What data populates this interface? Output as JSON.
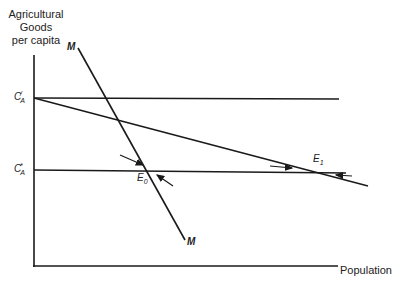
{
  "diagram": {
    "y_axis_label": "Agricultural Goods per capita",
    "y_axis_label_lines": [
      "Agricultural",
      "Goods",
      "per capita"
    ],
    "x_axis_label": "Population",
    "levels": {
      "upper": {
        "symbol": "C",
        "sub": "A",
        "sup": "/",
        "y": 98
      },
      "lower": {
        "symbol": "C",
        "sub": "A",
        "sup": "*",
        "y": 170
      }
    },
    "curves": {
      "M": {
        "label": "M",
        "top_label": "M",
        "bottom_label": "M"
      },
      "declining": {
        "label": ""
      }
    },
    "equilibria": [
      {
        "label": "E",
        "sub": "0"
      },
      {
        "label": "E",
        "sub": "1"
      }
    ],
    "colors": {
      "line": "#1a1a1a",
      "background": "#ffffff"
    }
  }
}
